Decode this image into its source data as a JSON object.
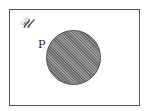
{
  "diagram": {
    "type": "venn",
    "universe": {
      "label": "𝒰"
    },
    "sets": [
      {
        "label": "P",
        "shaded": true,
        "fill_color": "#7a7a7a"
      }
    ],
    "border_color": "#555555"
  }
}
